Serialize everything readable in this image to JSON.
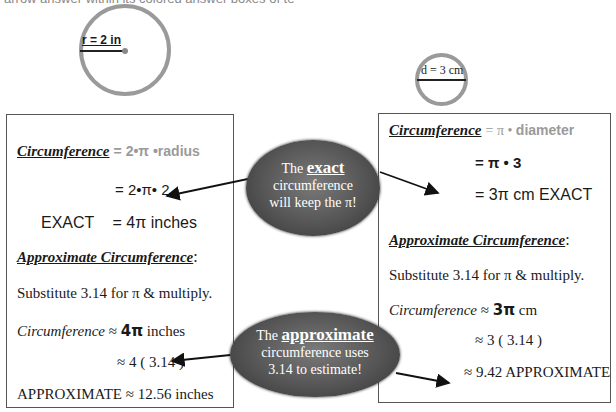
{
  "header": {
    "cut_off_text": "arrow answer within its colored answer boxes of text)"
  },
  "figures": {
    "left_circle": {
      "label": "r = 2 in"
    },
    "right_circle": {
      "label": "d = 3 cm"
    }
  },
  "left_box": {
    "heading": "Circumference",
    "formula_eq": "=",
    "formula": "2•π •radius",
    "step1": "= 2•π• 2",
    "exact_label": "EXACT",
    "exact_value": "= 4π inches",
    "approx_heading": "Approximate Circumference",
    "approx_colon": ":",
    "substitute": "Substitute 3.14 for π & multiply.",
    "circ_italic": "Circumference",
    "circ_approx_sym": " ≈ ",
    "circ_bold": "4π",
    "circ_unit": "  inches",
    "step2": "≈ 4 ( 3.14 )",
    "approx_result": "APPROXIMATE ≈ 12.56 inches"
  },
  "right_box": {
    "heading": "Circumference",
    "formula_eq": " = π • ",
    "formula": "diameter",
    "step1": "= π • 3",
    "exact_value": "=  3π  cm EXACT",
    "approx_heading": "Approximate Circumference",
    "approx_colon": ":",
    "substitute": "Substitute 3.14 for π & multiply.",
    "circ_italic": "Circumference",
    "circ_approx_sym": " ≈ ",
    "circ_bold": "3π",
    "circ_unit": "  cm",
    "step2": "≈ 3 ( 3.14 )",
    "approx_result": "≈ 9.42  APPROXIMATE"
  },
  "callouts": {
    "exact": {
      "the": "The ",
      "keyword": "exact",
      "line2": "circumference",
      "line3": "will keep the π!"
    },
    "approximate": {
      "the": "The ",
      "keyword": "approximate",
      "line2": "circumference uses",
      "line3": "3.14 to estimate!"
    }
  },
  "colors": {
    "circle_stroke": "#9a9a9a",
    "callout_fill": "#555555",
    "formula_gray": "#9a9a9a"
  }
}
